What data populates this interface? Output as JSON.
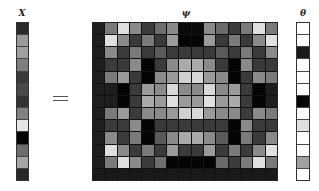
{
  "labels": {
    "x": "X",
    "equals": "=",
    "psi": "ψ",
    "theta": "θ"
  },
  "x_vector": [
    "#2a2a2a",
    "#9a9a9a",
    "#a0a0a0",
    "#7e7e7e",
    "#3a3a3a",
    "#4a4a4a",
    "#333333",
    "#808080",
    "#e6e6e6",
    "#050505",
    "#6e6e6e",
    "#a6a6a6",
    "#262626"
  ],
  "theta_vector": [
    "#ffffff",
    "#ffffff",
    "#1a1a1a",
    "#ffffff",
    "#ffffff",
    "#ffffff",
    "#080808",
    "#ffffff",
    "#e0e0e0",
    "#ffffff",
    "#ffffff",
    "#a0a0a0",
    "#ffffff"
  ],
  "psi_matrix": {
    "rows": 13,
    "cols": 15,
    "cells": [
      [
        "#1e1e1e",
        "#7a7a7a",
        "#e0e0e0",
        "#8a8a8a",
        "#3a3a3a",
        "#6e6e6e",
        "#8a8a8a",
        "#0a0a0a",
        "#0a0a0a",
        "#8a8a8a",
        "#6a6a6a",
        "#3a3a3a",
        "#7a7a7a",
        "#e0e0e0",
        "#7a7a7a"
      ],
      [
        "#1e1e1e",
        "#e0e0e0",
        "#8a8a8a",
        "#3a3a3a",
        "#7a7a7a",
        "#3a3a3a",
        "#9a9a9a",
        "#050505",
        "#050505",
        "#9a9a9a",
        "#3a3a3a",
        "#7a7a7a",
        "#3a3a3a",
        "#8a8a8a",
        "#e0e0e0"
      ],
      [
        "#1e1e1e",
        "#8a8a8a",
        "#3a3a3a",
        "#7a7a7a",
        "#3a3a3a",
        "#5a5a5a",
        "#3a3a3a",
        "#3a3a3a",
        "#3a3a3a",
        "#3a3a3a",
        "#5a5a5a",
        "#3a3a3a",
        "#7a7a7a",
        "#3a3a3a",
        "#8a8a8a"
      ],
      [
        "#1e1e1e",
        "#3a3a3a",
        "#3a3a3a",
        "#8a8a8a",
        "#050505",
        "#3a3a3a",
        "#8a8a8a",
        "#aaaaaa",
        "#aaaaaa",
        "#8a8a8a",
        "#3a3a3a",
        "#050505",
        "#8a8a8a",
        "#3a3a3a",
        "#3a3a3a"
      ],
      [
        "#1e1e1e",
        "#7a7a7a",
        "#9a9a9a",
        "#3a3a3a",
        "#050505",
        "#8a8a8a",
        "#9a9a9a",
        "#d0d0d0",
        "#d8d8d8",
        "#9a9a9a",
        "#8a8a8a",
        "#050505",
        "#3a3a3a",
        "#8a8a8a",
        "#7a7a7a"
      ],
      [
        "#1e1e1e",
        "#1e1e1e",
        "#050505",
        "#3a3a3a",
        "#9a9a9a",
        "#8a8a8a",
        "#d8d8d8",
        "#8a8a8a",
        "#8a8a8a",
        "#d8d8d8",
        "#8a8a8a",
        "#9a9a9a",
        "#3a3a3a",
        "#050505",
        "#1e1e1e"
      ],
      [
        "#1e1e1e",
        "#1e1e1e",
        "#050505",
        "#3a3a3a",
        "#aaaaaa",
        "#9a9a9a",
        "#e0e0e0",
        "#9a9a9a",
        "#9a9a9a",
        "#e0e0e0",
        "#9a9a9a",
        "#aaaaaa",
        "#3a3a3a",
        "#050505",
        "#1e1e1e"
      ],
      [
        "#1e1e1e",
        "#7a7a7a",
        "#9a9a9a",
        "#3a3a3a",
        "#8a8a8a",
        "#8a8a8a",
        "#9a9a9a",
        "#d0d0d0",
        "#d8d8d8",
        "#9a9a9a",
        "#8a8a8a",
        "#8a8a8a",
        "#3a3a3a",
        "#8a8a8a",
        "#7a7a7a"
      ],
      [
        "#1e1e1e",
        "#3a3a3a",
        "#3a3a3a",
        "#8a8a8a",
        "#050505",
        "#3a3a3a",
        "#3a3a3a",
        "#3a3a3a",
        "#3a3a3a",
        "#3a3a3a",
        "#3a3a3a",
        "#050505",
        "#8a8a8a",
        "#3a3a3a",
        "#3a3a3a"
      ],
      [
        "#1e1e1e",
        "#8a8a8a",
        "#3a3a3a",
        "#7a7a7a",
        "#050505",
        "#5a5a5a",
        "#8a8a8a",
        "#aaaaaa",
        "#aaaaaa",
        "#8a8a8a",
        "#5a5a5a",
        "#050505",
        "#7a7a7a",
        "#3a3a3a",
        "#8a8a8a"
      ],
      [
        "#1e1e1e",
        "#e0e0e0",
        "#8a8a8a",
        "#3a3a3a",
        "#7a7a7a",
        "#3a3a3a",
        "#9a9a9a",
        "#3a3a3a",
        "#3a3a3a",
        "#9a9a9a",
        "#3a3a3a",
        "#7a7a7a",
        "#3a3a3a",
        "#8a8a8a",
        "#e0e0e0"
      ],
      [
        "#1e1e1e",
        "#7a7a7a",
        "#e0e0e0",
        "#8a8a8a",
        "#3a3a3a",
        "#6e6e6e",
        "#050505",
        "#050505",
        "#050505",
        "#050505",
        "#6a6a6a",
        "#3a3a3a",
        "#7a7a7a",
        "#e0e0e0",
        "#7a7a7a"
      ],
      [
        "#1a1a1a",
        "#1a1a1a",
        "#1a1a1a",
        "#1a1a1a",
        "#1a1a1a",
        "#1a1a1a",
        "#1a1a1a",
        "#1a1a1a",
        "#1a1a1a",
        "#1a1a1a",
        "#1a1a1a",
        "#1a1a1a",
        "#1a1a1a",
        "#1a1a1a",
        "#1a1a1a"
      ]
    ]
  }
}
